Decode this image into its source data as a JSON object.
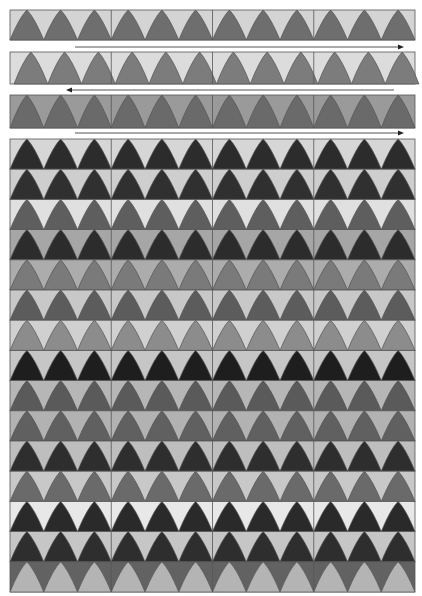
{
  "figure": {
    "panels": 4,
    "triangles_per_panel": 3,
    "outline_color": "#555555"
  },
  "strips": [
    {
      "y": 10,
      "h": 30,
      "bg": "#d4d4d4",
      "tri": "#6e6e6e",
      "offset": 0
    },
    {
      "y": 52,
      "h": 32,
      "bg": "#dcdcdc",
      "tri": "#7c7c7c",
      "offset": 4
    },
    {
      "y": 95,
      "h": 33,
      "bg": "#9a9a9a",
      "tri": "#6a6a6a",
      "offset": 0
    }
  ],
  "arrows": [
    {
      "y": 47,
      "x1": 75,
      "x2": 398,
      "direction": "right"
    },
    {
      "y": 90,
      "x1": 72,
      "x2": 394,
      "direction": "left"
    },
    {
      "y": 133,
      "x1": 75,
      "x2": 398,
      "direction": "right"
    }
  ],
  "grid": {
    "x": 10,
    "y": 139,
    "w": 405,
    "row_h": 30.2,
    "rows": [
      {
        "bg": "#d6d6d6",
        "tri": "#2c2c2c"
      },
      {
        "bg": "#cecece",
        "tri": "#303030"
      },
      {
        "bg": "#e0e0e0",
        "tri": "#5e5e5e"
      },
      {
        "bg": "#a6a6a6",
        "tri": "#2c2c2c"
      },
      {
        "bg": "#acacac",
        "tri": "#7a7a7a"
      },
      {
        "bg": "#c8c8c8",
        "tri": "#5c5c5c"
      },
      {
        "bg": "#d0d0d0",
        "tri": "#8c8c8c"
      },
      {
        "bg": "#c6c6c6",
        "tri": "#1e1e1e"
      },
      {
        "bg": "#b6b6b6",
        "tri": "#5a5a5a"
      },
      {
        "bg": "#b2b2b2",
        "tri": "#606060"
      },
      {
        "bg": "#bebebe",
        "tri": "#2e2e2e"
      },
      {
        "bg": "#c8c8c8",
        "tri": "#6a6a6a"
      },
      {
        "bg": "#e8e8e8",
        "tri": "#2a2a2a"
      },
      {
        "bg": "#c6c6c6",
        "tri": "#2e2e2e"
      },
      {
        "bg": "#626262",
        "tri": "#b4b4b4"
      }
    ]
  }
}
